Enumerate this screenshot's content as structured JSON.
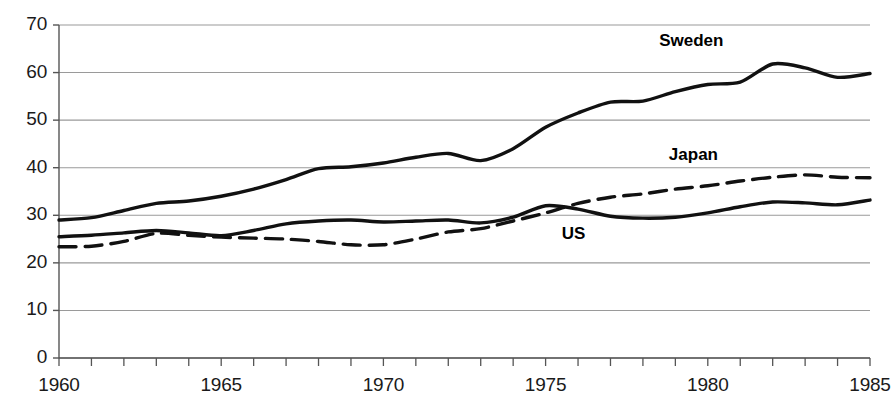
{
  "chart_data": {
    "type": "line",
    "title": "",
    "xlabel": "",
    "ylabel": "",
    "xlim": [
      1960,
      1985
    ],
    "ylim": [
      0,
      70
    ],
    "ytick_labels": [
      "70",
      "60",
      "50",
      "40",
      "30",
      "20",
      "10",
      "0"
    ],
    "ytick_values": [
      70,
      60,
      50,
      40,
      30,
      20,
      10,
      0
    ],
    "xtick_labels": [
      "1960",
      "1965",
      "1970",
      "1975",
      "1980",
      "1985"
    ],
    "xtick_values": [
      1960,
      1965,
      1970,
      1975,
      1980,
      1985
    ],
    "xtick_minor_step": 1,
    "grid": "horizontal",
    "legend": "inline-annotations",
    "x": [
      1960,
      1961,
      1962,
      1963,
      1964,
      1965,
      1966,
      1967,
      1968,
      1969,
      1970,
      1971,
      1972,
      1973,
      1974,
      1975,
      1976,
      1977,
      1978,
      1979,
      1980,
      1981,
      1982,
      1983,
      1984,
      1985
    ],
    "series": [
      {
        "name": "Sweden",
        "style": "solid",
        "color": "#111111",
        "label_x": 1978.5,
        "label_y": 66.5,
        "values": [
          29.0,
          29.5,
          31.0,
          32.5,
          33.0,
          34.0,
          35.5,
          37.5,
          39.8,
          40.2,
          41.0,
          42.2,
          43.0,
          41.5,
          44.0,
          48.5,
          51.5,
          53.8,
          54.0,
          56.0,
          57.5,
          58.0,
          61.8,
          61.0,
          59.0,
          59.8
        ]
      },
      {
        "name": "Japan",
        "style": "dashed",
        "color": "#111111",
        "label_x": 1978.8,
        "label_y": 42.5,
        "values": [
          23.4,
          23.5,
          24.5,
          26.2,
          25.8,
          25.4,
          25.2,
          25.0,
          24.5,
          23.8,
          23.8,
          25.0,
          26.5,
          27.2,
          28.8,
          30.5,
          32.5,
          33.8,
          34.5,
          35.5,
          36.2,
          37.2,
          38.0,
          38.5,
          38.0,
          37.9
        ]
      },
      {
        "name": "US",
        "style": "solid",
        "color": "#111111",
        "label_x": 1975.5,
        "label_y": 25.8,
        "values": [
          25.5,
          25.8,
          26.3,
          26.8,
          26.3,
          25.7,
          26.8,
          28.2,
          28.8,
          29.0,
          28.6,
          28.8,
          29.0,
          28.4,
          29.6,
          32.0,
          31.3,
          29.8,
          29.4,
          29.6,
          30.5,
          31.8,
          32.8,
          32.6,
          32.2,
          33.2
        ]
      }
    ]
  },
  "axis": {
    "y_axis_name": "y-axis",
    "x_axis_name": "x-axis"
  }
}
